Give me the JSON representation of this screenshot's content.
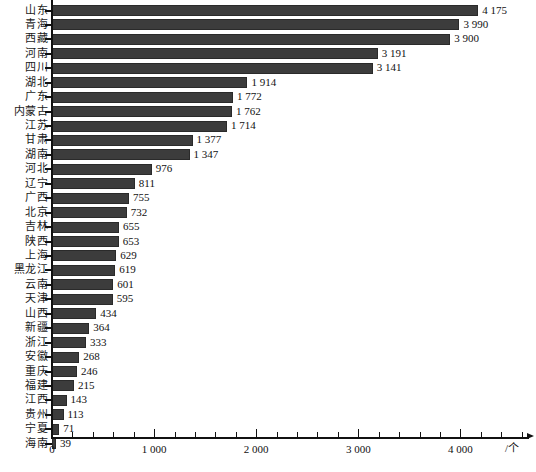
{
  "chart_data": {
    "type": "bar",
    "orientation": "horizontal",
    "title": "",
    "subtitle": "",
    "xlabel": "/个",
    "ylabel": "",
    "xlim": [
      0,
      4600
    ],
    "grid": false,
    "legend": null,
    "x_major_ticks": [
      0,
      1000,
      2000,
      3000,
      4000
    ],
    "x_major_tick_labels": [
      "0",
      "1 000",
      "2 000",
      "3 000",
      "4 000"
    ],
    "x_minor_tick_step": 200,
    "bar_color": "#3c3c3c",
    "bar_edge_color": "#2a2a2a",
    "axis_color": "#111111",
    "categories": [
      "山东",
      "青海",
      "西藏",
      "河南",
      "四川",
      "湖北",
      "广东",
      "内蒙古",
      "江苏",
      "甘肃",
      "湖南",
      "河北",
      "辽宁",
      "广西",
      "北京",
      "吉林",
      "陕西",
      "上海",
      "黑龙江",
      "云南",
      "天津",
      "山西",
      "新疆",
      "浙江",
      "安徽",
      "重庆",
      "福建",
      "江西",
      "贵州",
      "宁夏",
      "海南"
    ],
    "values": [
      4175,
      3990,
      3900,
      3191,
      3141,
      1914,
      1772,
      1762,
      1714,
      1377,
      1347,
      976,
      811,
      755,
      732,
      655,
      653,
      629,
      619,
      601,
      595,
      434,
      364,
      333,
      268,
      246,
      215,
      143,
      113,
      71,
      39
    ],
    "value_labels": [
      "4 175",
      "3 990",
      "3 900",
      "3 191",
      "3 141",
      "1 914",
      "1 772",
      "1 762",
      "1 714",
      "1 377",
      "1 347",
      "976",
      "811",
      "755",
      "732",
      "655",
      "653",
      "629",
      "619",
      "601",
      "595",
      "434",
      "364",
      "333",
      "268",
      "246",
      "215",
      "143",
      "113",
      "71",
      "39"
    ]
  }
}
